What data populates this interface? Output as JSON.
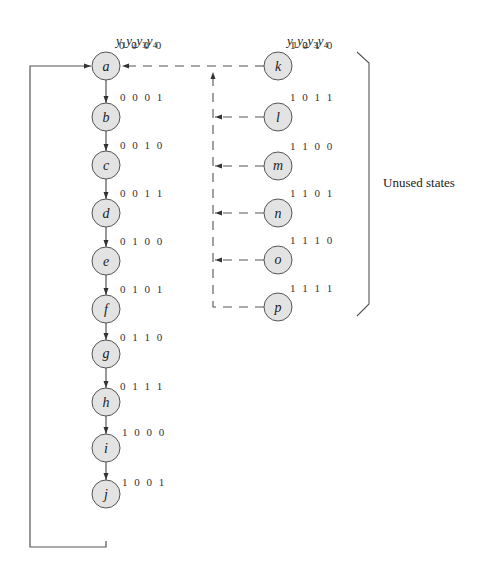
{
  "header_left": {
    "y": [
      "1",
      "2",
      "3",
      "4"
    ]
  },
  "header_right": {
    "y": [
      "1",
      "2",
      "3",
      "4"
    ]
  },
  "used_states": [
    {
      "name": "a",
      "code": "0 0 0 0"
    },
    {
      "name": "b",
      "code": "0 0 0 1"
    },
    {
      "name": "c",
      "code": "0 0 1 0"
    },
    {
      "name": "d",
      "code": "0 0 1 1"
    },
    {
      "name": "e",
      "code": "0 1 0 0"
    },
    {
      "name": "f",
      "code": "0 1 0 1"
    },
    {
      "name": "g",
      "code": "0 1 1 0"
    },
    {
      "name": "h",
      "code": "0 1 1 1"
    },
    {
      "name": "i",
      "code": "1 0 0 0"
    },
    {
      "name": "j",
      "code": "1 0 0 1"
    }
  ],
  "unused_states": [
    {
      "name": "k",
      "code": "1 0 1 0"
    },
    {
      "name": "l",
      "code": "1 0 1 1"
    },
    {
      "name": "m",
      "code": "1 1 0 0"
    },
    {
      "name": "n",
      "code": "1 1 0 1"
    },
    {
      "name": "o",
      "code": "1 1 1 0"
    },
    {
      "name": "p",
      "code": "1 1 1 1"
    }
  ],
  "bracket_label": "Unused states",
  "colors": {
    "node_fill": "#e3e3e3",
    "stroke": "#555555"
  }
}
